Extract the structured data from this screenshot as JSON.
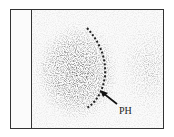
{
  "figure": {
    "annotation_label": "PH",
    "colors": {
      "ink": "#222222",
      "background": "#fbfbfb"
    }
  }
}
